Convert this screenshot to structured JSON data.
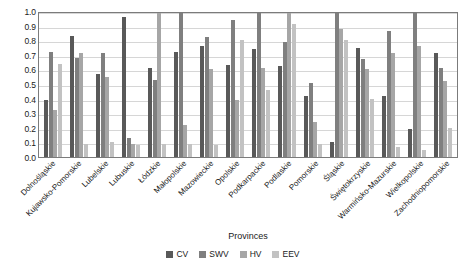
{
  "chart_data": {
    "type": "bar",
    "title": "",
    "xlabel": "Provinces",
    "ylabel": "",
    "ylim": [
      0.0,
      1.0
    ],
    "ytick_labels": [
      "1.0",
      "0.9",
      "0.8",
      "0.7",
      "0.6",
      "0.5",
      "0.4",
      "0.3",
      "0.2",
      "0.1",
      "0.0"
    ],
    "yticks": [
      1.0,
      0.9,
      0.8,
      0.7,
      0.6,
      0.5,
      0.4,
      0.3,
      0.2,
      0.1,
      0.0
    ],
    "grid": true,
    "legend_position": "bottom",
    "categories": [
      "Dolnośląskie",
      "Kujawsko-Pomorskie",
      "Lubelskie",
      "Lubuskie",
      "Łódzkie",
      "Małopolskie",
      "Mazowieckie",
      "Opolskie",
      "Podkarpackie",
      "Podlaskie",
      "Pomorskie",
      "Śląskie",
      "Świętokrzyskie",
      "Warmińsko-Mazurskie",
      "Wielkopolskie",
      "Zachodniopomorskie"
    ],
    "series": [
      {
        "name": "CV",
        "color": "#595959",
        "values": [
          0.39,
          0.83,
          0.57,
          0.96,
          0.61,
          0.72,
          0.76,
          0.63,
          0.74,
          0.62,
          0.42,
          0.1,
          0.75,
          0.42,
          0.19,
          0.71
        ]
      },
      {
        "name": "SWV",
        "color": "#7f7f7f",
        "values": [
          0.72,
          0.68,
          0.71,
          0.13,
          0.53,
          1.0,
          0.82,
          0.94,
          1.0,
          0.79,
          0.51,
          1.0,
          0.67,
          0.86,
          1.0,
          0.61
        ]
      },
      {
        "name": "HV",
        "color": "#a6a6a6",
        "values": [
          0.32,
          0.71,
          0.55,
          0.09,
          1.0,
          0.22,
          0.6,
          0.39,
          0.61,
          1.0,
          0.24,
          0.88,
          0.6,
          0.71,
          0.76,
          0.52
        ]
      },
      {
        "name": "EEV",
        "color": "#c2c2c2",
        "values": [
          0.64,
          0.09,
          0.1,
          0.08,
          0.09,
          0.09,
          0.08,
          0.8,
          0.46,
          0.91,
          0.09,
          0.8,
          0.4,
          0.07,
          0.05,
          0.2
        ]
      }
    ]
  },
  "legend": {
    "items": [
      {
        "label": "CV"
      },
      {
        "label": "SWV"
      },
      {
        "label": "HV"
      },
      {
        "label": "EEV"
      }
    ]
  }
}
